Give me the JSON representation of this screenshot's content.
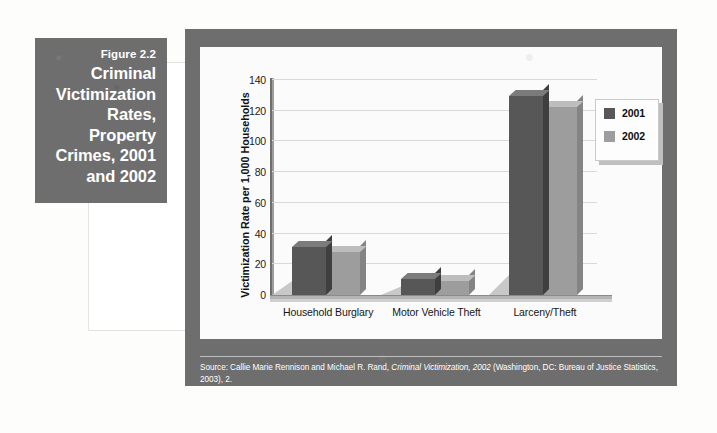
{
  "figure": {
    "number": "Figure 2.2",
    "title": "Criminal Victimization Rates, Property Crimes, 2001 and 2002",
    "source_prefix": "Source: Callie Marie Rennison and Michael R. Rand, ",
    "source_italic": "Criminal Victimization, 2002",
    "source_suffix": " (Washington, DC: Bureau of Justice Statistics, 2003), 2.",
    "source_line2": "Online at http://www.ojp.usdoj.gov/bjs/pub/pdf/cv02.pdf"
  },
  "colors": {
    "series_2001": "#575757",
    "series_2002": "#9d9d9d",
    "frame": "#6e6e6e",
    "caption_box": "#6e6e6e",
    "gridline": "#d9d9d9",
    "plot_background": "#fbfbfb"
  },
  "chart_data": {
    "type": "bar",
    "title": "Criminal Victimization Rates, Property Crimes, 2001 and 2002",
    "subtitle": "",
    "categories": [
      "Household Burglary",
      "Motor Vehicle Theft",
      "Larceny/Theft"
    ],
    "series": [
      {
        "name": "2001",
        "values": [
          31.0,
          10.2,
          129.4
        ],
        "color": "#575757"
      },
      {
        "name": "2002",
        "values": [
          28.0,
          9.0,
          122.3
        ],
        "color": "#9d9d9d"
      }
    ],
    "xlabel": "",
    "ylabel": "Victimization Rate per 1,000 Households",
    "ylim": [
      0,
      140
    ],
    "yticks": [
      0,
      20,
      40,
      60,
      80,
      100,
      120,
      140
    ],
    "ytick_labels": [
      "0",
      "20",
      "40",
      "60",
      "80",
      "100",
      "120",
      "140"
    ],
    "grid": true,
    "grid_axis": "y",
    "legend_position": "top-right",
    "legend_entries": [
      "2001",
      "2002"
    ],
    "three_d": true,
    "annotations": []
  }
}
